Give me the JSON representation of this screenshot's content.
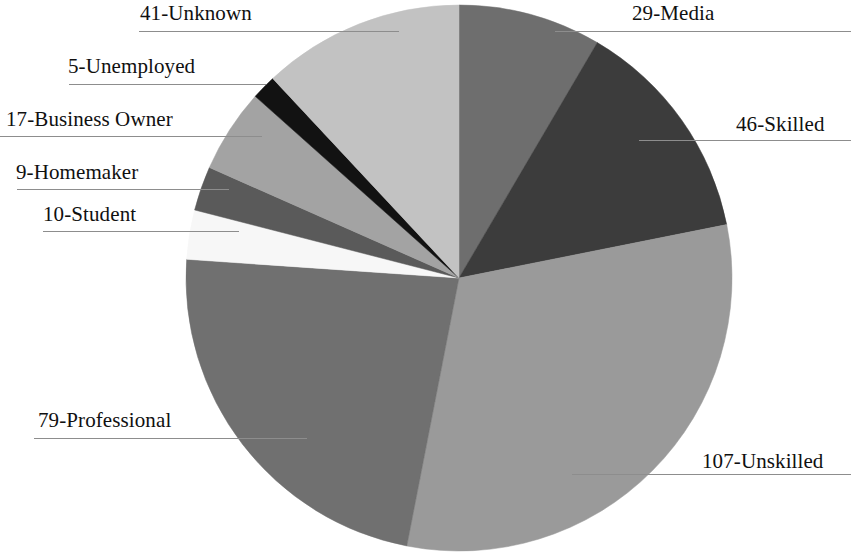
{
  "chart_data": {
    "type": "pie",
    "title": "",
    "subtitle": "",
    "xlabel": "",
    "ylabel": "",
    "legend_position": "none",
    "grid": false,
    "total": 343,
    "label_format": "value-category",
    "start_angle_deg": 0,
    "direction": "clockwise",
    "categories": [
      "Media",
      "Skilled",
      "Unskilled",
      "Professional",
      "Student",
      "Homemaker",
      "Business Owner",
      "Unemployed",
      "Unknown"
    ],
    "values": [
      29,
      46,
      107,
      79,
      10,
      9,
      17,
      5,
      41
    ],
    "colors": [
      "#6e6e6e",
      "#3c3c3c",
      "#9a9a9a",
      "#707070",
      "#f7f7f7",
      "#5a5a5a",
      "#a3a3a3",
      "#121212",
      "#c2c2c2"
    ],
    "slices": [
      {
        "label": "29-Media",
        "category": "Media",
        "value": 29,
        "color": "#6e6e6e"
      },
      {
        "label": "46-Skilled",
        "category": "Skilled",
        "value": 46,
        "color": "#3c3c3c"
      },
      {
        "label": "107-Unskilled",
        "category": "Unskilled",
        "value": 107,
        "color": "#9a9a9a"
      },
      {
        "label": "79-Professional",
        "category": "Professional",
        "value": 79,
        "color": "#707070"
      },
      {
        "label": "10-Student",
        "category": "Student",
        "value": 10,
        "color": "#f7f7f7"
      },
      {
        "label": "9-Homemaker",
        "category": "Homemaker",
        "value": 9,
        "color": "#5a5a5a"
      },
      {
        "label": "17-Business Owner",
        "category": "Business Owner",
        "value": 17,
        "color": "#a3a3a3"
      },
      {
        "label": "5-Unemployed",
        "category": "Unemployed",
        "value": 5,
        "color": "#121212"
      },
      {
        "label": "41-Unknown",
        "category": "Unknown",
        "value": 41,
        "color": "#c2c2c2"
      }
    ]
  },
  "labels": {
    "unknown": "41-Unknown",
    "unemployed": "5-Unemployed",
    "business_owner": "17-Business Owner",
    "homemaker": "9-Homemaker",
    "student": "10-Student",
    "professional": "79-Professional",
    "unskilled": "107-Unskilled",
    "media": "29-Media",
    "skilled": "46-Skilled"
  }
}
